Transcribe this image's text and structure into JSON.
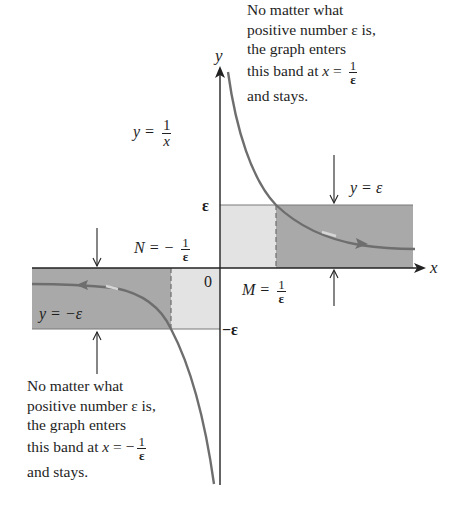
{
  "figure": {
    "axes": {
      "x_label": "x",
      "y_label": "y",
      "origin_label": "0",
      "epsilon_tick": "ε",
      "neg_epsilon_tick": "−ε"
    },
    "labels": {
      "curve_eq_lhs": "y =",
      "curve_eq_num": "1",
      "curve_eq_den": "x",
      "upper_band": "y = ε",
      "lower_band": "y = −ε",
      "M_lhs": "M =",
      "M_num": "1",
      "M_den": "ε",
      "N_lhs": "N = −",
      "N_num": "1",
      "N_den": "ε"
    },
    "annotation_right": {
      "line1": "No matter what",
      "line2": "positive number ε is,",
      "line3": "the graph enters",
      "line4_prefix": "this band at ",
      "line4_var": "x",
      "line4_eq": " = ",
      "line4_num": "1",
      "line4_den": "ε",
      "line5": "and stays."
    },
    "annotation_left": {
      "line1": "No matter what",
      "line2": "positive number ε is,",
      "line3": "the graph enters",
      "line4_prefix": "this band at ",
      "line4_var": "x",
      "line4_eq": " = −",
      "line4_num": "1",
      "line4_den": "ε",
      "line5": "and stays."
    },
    "colors": {
      "band_dark": "#a9a9a9",
      "band_light": "#e3e3e3",
      "curve": "#6e6e6e",
      "axis": "#222222"
    }
  }
}
